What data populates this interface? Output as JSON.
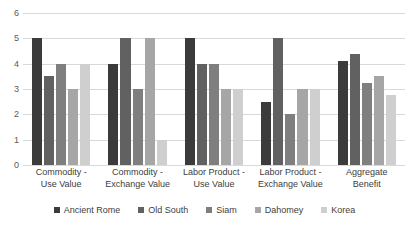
{
  "chart_data": {
    "type": "bar",
    "title": "",
    "xlabel": "",
    "ylabel": "",
    "ylim": [
      0,
      6
    ],
    "yticks": [
      0,
      1,
      2,
      3,
      4,
      5,
      6
    ],
    "grid": true,
    "legend_position": "bottom",
    "categories": [
      "Commodity - Use Value",
      "Commodity - Exchange Value",
      "Labor Product - Use Value",
      "Labor Product - Exchange Value",
      "Aggregate Benefit"
    ],
    "category_lines": [
      [
        "Commodity -",
        "Use Value"
      ],
      [
        "Commodity -",
        "Exchange Value"
      ],
      [
        "Labor Product -",
        "Use Value"
      ],
      [
        "Labor Product -",
        "Exchange Value"
      ],
      [
        "Aggregate",
        "Benefit"
      ]
    ],
    "series": [
      {
        "name": "Ancient Rome",
        "color": "#3b3b3b",
        "values": [
          5,
          4,
          5,
          2.5,
          4.1
        ]
      },
      {
        "name": "Old South",
        "color": "#616161",
        "values": [
          3.5,
          5,
          4,
          5,
          4.4
        ]
      },
      {
        "name": "Siam",
        "color": "#7f7f7f",
        "values": [
          4,
          3,
          4,
          2,
          3.25
        ]
      },
      {
        "name": "Dahomey",
        "color": "#a6a6a6",
        "values": [
          3,
          5,
          3,
          3,
          3.5
        ]
      },
      {
        "name": "Korea",
        "color": "#cfcfcf",
        "values": [
          4,
          1,
          3,
          3,
          2.75
        ]
      }
    ]
  },
  "colors": {
    "gridline": "#d9d9d9",
    "axis_text": "#595959",
    "label_text": "#404040",
    "background": "#ffffff"
  }
}
